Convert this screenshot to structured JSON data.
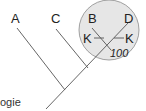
{
  "diagram": {
    "type": "cladogram",
    "taxa": {
      "a": "A",
      "c": "C",
      "b": "B",
      "d": "D"
    },
    "characters": {
      "left_marker": "K",
      "right_marker": "K"
    },
    "node_support": "100",
    "caption_fragment": "ogie",
    "colors": {
      "circle_fill": "#e6e6e6",
      "circle_stroke": "#8a8a8a",
      "line": "#555555",
      "text": "#222222"
    }
  }
}
